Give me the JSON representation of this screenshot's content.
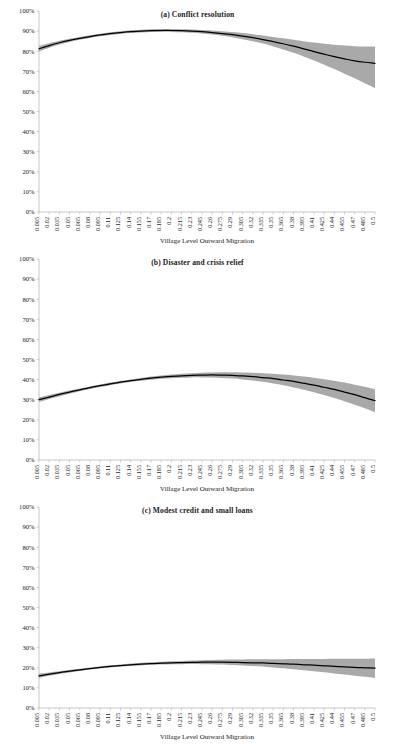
{
  "figure": {
    "width": 395,
    "height": 744,
    "band_color": "#a9a9a9",
    "line_color": "#000000",
    "axis_color": "#b0b0b0"
  },
  "chart_data": [
    {
      "type": "line",
      "title": "(a) Conflict resolution",
      "xlabel": "Village Level Outward Migration",
      "ylabel": "",
      "grid": false,
      "legend": "none",
      "xlim": [
        0.005,
        0.5
      ],
      "ylim": [
        0,
        1
      ],
      "ytick_labels": [
        "100%",
        "90%",
        "80%",
        "70%",
        "60%",
        "50%",
        "40%",
        "30%",
        "20%",
        "10%",
        "0%"
      ],
      "ytick_values": [
        1,
        0.9,
        0.8,
        0.7,
        0.6,
        0.5,
        0.4,
        0.3,
        0.2,
        0.1,
        0
      ],
      "xtick_labels": [
        "0.005",
        "0.02",
        "0.035",
        "0.05",
        "0.065",
        "0.08",
        "0.095",
        "0.11",
        "0.125",
        "0.14",
        "0.155",
        "0.17",
        "0.185",
        "0.2",
        "0.215",
        "0.23",
        "0.245",
        "0.26",
        "0.275",
        "0.29",
        "0.305",
        "0.32",
        "0.335",
        "0.35",
        "0.365",
        "0.38",
        "0.395",
        "0.41",
        "0.425",
        "0.44",
        "0.455",
        "0.47",
        "0.485",
        "0.5"
      ],
      "x": [
        0.005,
        0.02,
        0.035,
        0.05,
        0.065,
        0.08,
        0.095,
        0.11,
        0.125,
        0.14,
        0.155,
        0.17,
        0.185,
        0.2,
        0.215,
        0.23,
        0.245,
        0.26,
        0.275,
        0.29,
        0.305,
        0.32,
        0.335,
        0.35,
        0.365,
        0.38,
        0.395,
        0.41,
        0.425,
        0.44,
        0.455,
        0.47,
        0.485,
        0.5
      ],
      "series": [
        {
          "name": "fitted",
          "values": [
            0.812,
            0.828,
            0.842,
            0.854,
            0.864,
            0.873,
            0.881,
            0.888,
            0.893,
            0.897,
            0.9,
            0.902,
            0.903,
            0.903,
            0.902,
            0.9,
            0.897,
            0.893,
            0.888,
            0.882,
            0.875,
            0.867,
            0.858,
            0.848,
            0.837,
            0.825,
            0.812,
            0.798,
            0.383,
            0.383,
            0.383,
            0.383,
            0.383,
            0.383
          ]
        },
        {
          "name": "fitted_full",
          "values": [
            0.812,
            0.828,
            0.842,
            0.854,
            0.864,
            0.873,
            0.881,
            0.888,
            0.893,
            0.897,
            0.9,
            0.902,
            0.903,
            0.903,
            0.902,
            0.9,
            0.897,
            0.893,
            0.888,
            0.882,
            0.875,
            0.867,
            0.858,
            0.848,
            0.837,
            0.825,
            0.812,
            0.798,
            0.785,
            0.773,
            0.762,
            0.752,
            0.745,
            0.74
          ]
        },
        {
          "name": "ci_lower",
          "values": [
            0.798,
            0.817,
            0.833,
            0.846,
            0.857,
            0.866,
            0.874,
            0.881,
            0.886,
            0.89,
            0.893,
            0.895,
            0.896,
            0.896,
            0.894,
            0.892,
            0.888,
            0.883,
            0.877,
            0.869,
            0.86,
            0.85,
            0.838,
            0.824,
            0.809,
            0.792,
            0.774,
            0.754,
            0.733,
            0.711,
            0.688,
            0.665,
            0.641,
            0.617
          ]
        },
        {
          "name": "ci_upper",
          "values": [
            0.827,
            0.84,
            0.852,
            0.862,
            0.871,
            0.879,
            0.887,
            0.894,
            0.899,
            0.904,
            0.907,
            0.909,
            0.91,
            0.91,
            0.909,
            0.908,
            0.906,
            0.903,
            0.899,
            0.895,
            0.89,
            0.884,
            0.878,
            0.871,
            0.864,
            0.857,
            0.85,
            0.843,
            0.837,
            0.832,
            0.828,
            0.825,
            0.824,
            0.824
          ]
        }
      ]
    },
    {
      "type": "line",
      "title": "(b) Disaster and crisis relief",
      "xlabel": "Village Level Outward Migration",
      "ylabel": "",
      "grid": false,
      "legend": "none",
      "xlim": [
        0.005,
        0.5
      ],
      "ylim": [
        0,
        1
      ],
      "ytick_labels": [
        "100%",
        "90%",
        "80%",
        "70%",
        "60%",
        "50%",
        "40%",
        "30%",
        "20%",
        "10%",
        "0%"
      ],
      "ytick_values": [
        1,
        0.9,
        0.8,
        0.7,
        0.6,
        0.5,
        0.4,
        0.3,
        0.2,
        0.1,
        0
      ],
      "xtick_labels": [
        "0.005",
        "0.02",
        "0.035",
        "0.05",
        "0.065",
        "0.08",
        "0.095",
        "0.11",
        "0.125",
        "0.14",
        "0.155",
        "0.17",
        "0.185",
        "0.2",
        "0.215",
        "0.23",
        "0.245",
        "0.26",
        "0.275",
        "0.29",
        "0.305",
        "0.32",
        "0.335",
        "0.35",
        "0.365",
        "0.38",
        "0.395",
        "0.41",
        "0.425",
        "0.44",
        "0.455",
        "0.47",
        "0.485",
        "0.5"
      ],
      "x": [
        0.005,
        0.02,
        0.035,
        0.05,
        0.065,
        0.08,
        0.095,
        0.11,
        0.125,
        0.14,
        0.155,
        0.17,
        0.185,
        0.2,
        0.215,
        0.23,
        0.245,
        0.26,
        0.275,
        0.29,
        0.305,
        0.32,
        0.335,
        0.35,
        0.365,
        0.38,
        0.395,
        0.41,
        0.425,
        0.44,
        0.455,
        0.47,
        0.485,
        0.5
      ],
      "series": [
        {
          "name": "fitted_full",
          "values": [
            0.3,
            0.313,
            0.326,
            0.338,
            0.349,
            0.36,
            0.37,
            0.379,
            0.387,
            0.395,
            0.401,
            0.407,
            0.412,
            0.416,
            0.419,
            0.421,
            0.422,
            0.423,
            0.422,
            0.421,
            0.418,
            0.415,
            0.41,
            0.405,
            0.398,
            0.391,
            0.382,
            0.373,
            0.362,
            0.351,
            0.338,
            0.325,
            0.31,
            0.295
          ]
        },
        {
          "name": "ci_lower",
          "values": [
            0.288,
            0.303,
            0.317,
            0.33,
            0.342,
            0.353,
            0.363,
            0.372,
            0.38,
            0.388,
            0.394,
            0.399,
            0.404,
            0.407,
            0.409,
            0.411,
            0.411,
            0.41,
            0.408,
            0.405,
            0.401,
            0.395,
            0.389,
            0.381,
            0.372,
            0.361,
            0.35,
            0.337,
            0.323,
            0.308,
            0.292,
            0.275,
            0.257,
            0.238
          ]
        },
        {
          "name": "ci_upper",
          "values": [
            0.312,
            0.324,
            0.335,
            0.346,
            0.356,
            0.366,
            0.376,
            0.385,
            0.394,
            0.401,
            0.408,
            0.415,
            0.42,
            0.425,
            0.429,
            0.432,
            0.434,
            0.435,
            0.436,
            0.436,
            0.435,
            0.434,
            0.432,
            0.429,
            0.425,
            0.421,
            0.415,
            0.409,
            0.402,
            0.394,
            0.385,
            0.375,
            0.364,
            0.352
          ]
        }
      ]
    },
    {
      "type": "line",
      "title": "(c) Modest credit and small loans",
      "xlabel": "Village Level Outward Migration",
      "ylabel": "",
      "grid": false,
      "legend": "none",
      "xlim": [
        0.005,
        0.5
      ],
      "ylim": [
        0,
        1
      ],
      "ytick_labels": [
        "100%",
        "90%",
        "80%",
        "70%",
        "60%",
        "50%",
        "40%",
        "30%",
        "20%",
        "10%",
        "0%"
      ],
      "ytick_values": [
        1,
        0.9,
        0.8,
        0.7,
        0.6,
        0.5,
        0.4,
        0.3,
        0.2,
        0.1,
        0
      ],
      "xtick_labels": [
        "0.005",
        "0.02",
        "0.035",
        "0.05",
        "0.065",
        "0.08",
        "0.095",
        "0.11",
        "0.125",
        "0.14",
        "0.155",
        "0.17",
        "0.185",
        "0.2",
        "0.215",
        "0.23",
        "0.245",
        "0.26",
        "0.275",
        "0.29",
        "0.305",
        "0.32",
        "0.335",
        "0.35",
        "0.365",
        "0.38",
        "0.395",
        "0.41",
        "0.425",
        "0.44",
        "0.455",
        "0.47",
        "0.485",
        "0.5"
      ],
      "x": [
        0.005,
        0.02,
        0.035,
        0.05,
        0.065,
        0.08,
        0.095,
        0.11,
        0.125,
        0.14,
        0.155,
        0.17,
        0.185,
        0.2,
        0.215,
        0.23,
        0.245,
        0.26,
        0.275,
        0.29,
        0.305,
        0.32,
        0.335,
        0.35,
        0.365,
        0.38,
        0.395,
        0.41,
        0.425,
        0.44,
        0.455,
        0.47,
        0.485,
        0.5
      ],
      "series": [
        {
          "name": "fitted_full",
          "values": [
            0.16,
            0.168,
            0.176,
            0.183,
            0.19,
            0.196,
            0.202,
            0.207,
            0.211,
            0.215,
            0.218,
            0.221,
            0.223,
            0.225,
            0.226,
            0.227,
            0.228,
            0.228,
            0.228,
            0.227,
            0.226,
            0.225,
            0.224,
            0.222,
            0.22,
            0.218,
            0.215,
            0.213,
            0.21,
            0.207,
            0.205,
            0.202,
            0.2,
            0.198
          ]
        },
        {
          "name": "ci_lower",
          "values": [
            0.15,
            0.16,
            0.169,
            0.177,
            0.184,
            0.191,
            0.196,
            0.201,
            0.206,
            0.209,
            0.212,
            0.215,
            0.216,
            0.218,
            0.218,
            0.219,
            0.218,
            0.218,
            0.216,
            0.214,
            0.212,
            0.209,
            0.206,
            0.202,
            0.198,
            0.193,
            0.188,
            0.183,
            0.178,
            0.172,
            0.167,
            0.161,
            0.156,
            0.15
          ]
        },
        {
          "name": "ci_upper",
          "values": [
            0.171,
            0.177,
            0.183,
            0.189,
            0.195,
            0.201,
            0.207,
            0.213,
            0.217,
            0.221,
            0.225,
            0.228,
            0.23,
            0.232,
            0.234,
            0.236,
            0.238,
            0.239,
            0.24,
            0.241,
            0.241,
            0.242,
            0.242,
            0.243,
            0.243,
            0.244,
            0.244,
            0.244,
            0.244,
            0.245,
            0.245,
            0.245,
            0.245,
            0.246
          ]
        }
      ]
    }
  ]
}
